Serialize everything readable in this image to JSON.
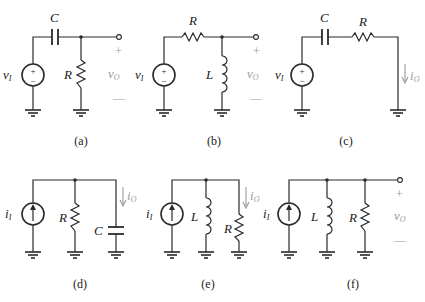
{
  "figure": {
    "circuits": [
      {
        "id": "a",
        "caption": "(a)",
        "source": {
          "type": "voltage",
          "symbol": "v",
          "subscript": "I",
          "plus": "+",
          "minus": "−"
        },
        "components": [
          {
            "name": "C",
            "type": "capacitor",
            "placement": "series"
          },
          {
            "name": "R",
            "type": "resistor",
            "placement": "shunt"
          }
        ],
        "output": {
          "type": "voltage",
          "symbol": "v",
          "subscript": "O",
          "plus": "+",
          "minus": "—"
        }
      },
      {
        "id": "b",
        "caption": "(b)",
        "source": {
          "type": "voltage",
          "symbol": "v",
          "subscript": "I",
          "plus": "+",
          "minus": "−"
        },
        "components": [
          {
            "name": "R",
            "type": "resistor",
            "placement": "series"
          },
          {
            "name": "L",
            "type": "inductor",
            "placement": "shunt"
          }
        ],
        "output": {
          "type": "voltage",
          "symbol": "v",
          "subscript": "O",
          "plus": "+",
          "minus": "—"
        }
      },
      {
        "id": "c",
        "caption": "(c)",
        "source": {
          "type": "voltage",
          "symbol": "v",
          "subscript": "I",
          "plus": "+",
          "minus": "−"
        },
        "components": [
          {
            "name": "C",
            "type": "capacitor",
            "placement": "series"
          },
          {
            "name": "R",
            "type": "resistor",
            "placement": "series"
          }
        ],
        "output": {
          "type": "current",
          "symbol": "i",
          "subscript": "O"
        }
      },
      {
        "id": "d",
        "caption": "(d)",
        "source": {
          "type": "current",
          "symbol": "i",
          "subscript": "I"
        },
        "components": [
          {
            "name": "R",
            "type": "resistor",
            "placement": "shunt"
          },
          {
            "name": "C",
            "type": "capacitor",
            "placement": "shunt"
          }
        ],
        "output": {
          "type": "current",
          "symbol": "i",
          "subscript": "O"
        }
      },
      {
        "id": "e",
        "caption": "(e)",
        "source": {
          "type": "current",
          "symbol": "i",
          "subscript": "I"
        },
        "components": [
          {
            "name": "L",
            "type": "inductor",
            "placement": "shunt"
          },
          {
            "name": "R",
            "type": "resistor",
            "placement": "shunt"
          }
        ],
        "output": {
          "type": "current",
          "symbol": "i",
          "subscript": "O"
        }
      },
      {
        "id": "f",
        "caption": "(f)",
        "source": {
          "type": "current",
          "symbol": "i",
          "subscript": "I"
        },
        "components": [
          {
            "name": "L",
            "type": "inductor",
            "placement": "shunt"
          },
          {
            "name": "R",
            "type": "resistor",
            "placement": "shunt"
          }
        ],
        "output": {
          "type": "voltage",
          "symbol": "v",
          "subscript": "O",
          "plus": "+",
          "minus": "—"
        }
      }
    ]
  }
}
